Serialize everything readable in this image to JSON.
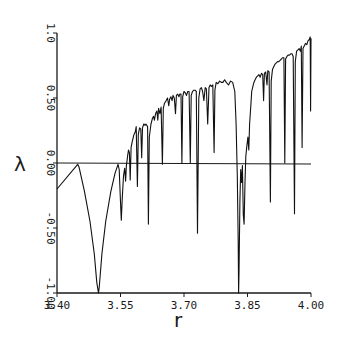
{
  "chart_data": {
    "type": "line",
    "title": "",
    "xlabel": "r",
    "ylabel": "λ",
    "xlim": [
      3.4,
      4.0
    ],
    "ylim": [
      -1.0,
      1.0
    ],
    "grid": false,
    "legend": null,
    "x_ticks": [
      "3.40",
      "3.55",
      "3.70",
      "3.85",
      "4.00"
    ],
    "y_ticks": [
      "1.0",
      "0.50",
      "0.00",
      "-0.50",
      "-1.00"
    ],
    "reference_line": {
      "y": 0.0,
      "label": "λ = 0"
    },
    "series": [
      {
        "name": "Lyapunov exponent",
        "color": "#111111",
        "points": [
          [
            3.4,
            -0.2
          ],
          [
            3.449,
            -0.01
          ],
          [
            3.452,
            -0.03
          ],
          [
            3.465,
            -0.22
          ],
          [
            3.478,
            -0.45
          ],
          [
            3.488,
            -0.7
          ],
          [
            3.494,
            -0.92
          ],
          [
            3.498,
            -1.0
          ],
          [
            3.5,
            -0.95
          ],
          [
            3.506,
            -0.7
          ],
          [
            3.515,
            -0.45
          ],
          [
            3.527,
            -0.22
          ],
          [
            3.537,
            -0.08
          ],
          [
            3.544,
            -0.01
          ],
          [
            3.547,
            -0.05
          ],
          [
            3.55,
            -0.3
          ],
          [
            3.552,
            -0.44
          ],
          [
            3.554,
            -0.28
          ],
          [
            3.557,
            -0.1
          ],
          [
            3.56,
            -0.04
          ],
          [
            3.562,
            -0.14
          ],
          [
            3.564,
            -0.02
          ],
          [
            3.567,
            0.06
          ],
          [
            3.569,
            0.1
          ],
          [
            3.571,
            0.08
          ],
          [
            3.573,
            -0.13
          ],
          [
            3.575,
            0.12
          ],
          [
            3.578,
            0.17
          ],
          [
            3.582,
            0.22
          ],
          [
            3.585,
            0.24
          ],
          [
            3.587,
            0.28
          ],
          [
            3.59,
            -0.18
          ],
          [
            3.592,
            0.22
          ],
          [
            3.595,
            0.27
          ],
          [
            3.598,
            0.26
          ],
          [
            3.6,
            0.04
          ],
          [
            3.602,
            0.27
          ],
          [
            3.605,
            0.3
          ],
          [
            3.608,
            0.29
          ],
          [
            3.61,
            0.3
          ],
          [
            3.614,
            0.28
          ],
          [
            3.616,
            -0.47
          ],
          [
            3.618,
            0.2
          ],
          [
            3.622,
            0.3
          ],
          [
            3.625,
            0.34
          ],
          [
            3.628,
            0.36
          ],
          [
            3.63,
            0.33
          ],
          [
            3.633,
            0.38
          ],
          [
            3.636,
            0.4
          ],
          [
            3.638,
            0.33
          ],
          [
            3.64,
            0.42
          ],
          [
            3.643,
            0.38
          ],
          [
            3.646,
            0.43
          ],
          [
            3.649,
            -0.01
          ],
          [
            3.651,
            0.42
          ],
          [
            3.654,
            0.46
          ],
          [
            3.658,
            0.48
          ],
          [
            3.661,
            0.5
          ],
          [
            3.664,
            0.44
          ],
          [
            3.666,
            0.49
          ],
          [
            3.669,
            0.51
          ],
          [
            3.672,
            0.48
          ],
          [
            3.674,
            0.52
          ],
          [
            3.677,
            0.5
          ],
          [
            3.68,
            0.38
          ],
          [
            3.682,
            0.52
          ],
          [
            3.685,
            0.53
          ],
          [
            3.688,
            0.51
          ],
          [
            3.69,
            0.53
          ],
          [
            3.693,
            0.53
          ],
          [
            3.695,
            0.0
          ],
          [
            3.697,
            0.51
          ],
          [
            3.7,
            0.55
          ],
          [
            3.703,
            0.54
          ],
          [
            3.706,
            0.52
          ],
          [
            3.709,
            0.55
          ],
          [
            3.712,
            0.55
          ],
          [
            3.715,
            0.0
          ],
          [
            3.717,
            0.52
          ],
          [
            3.72,
            0.55
          ],
          [
            3.723,
            0.56
          ],
          [
            3.726,
            0.56
          ],
          [
            3.729,
            0.55
          ],
          [
            3.732,
            -0.54
          ],
          [
            3.735,
            0.5
          ],
          [
            3.738,
            0.57
          ],
          [
            3.741,
            0.58
          ],
          [
            3.744,
            0.55
          ],
          [
            3.747,
            0.48
          ],
          [
            3.75,
            0.58
          ],
          [
            3.753,
            0.57
          ],
          [
            3.756,
            0.3
          ],
          [
            3.759,
            0.58
          ],
          [
            3.762,
            0.6
          ],
          [
            3.765,
            0.59
          ],
          [
            3.768,
            0.6
          ],
          [
            3.771,
            0.08
          ],
          [
            3.773,
            0.56
          ],
          [
            3.776,
            0.62
          ],
          [
            3.78,
            0.61
          ],
          [
            3.784,
            0.63
          ],
          [
            3.788,
            0.62
          ],
          [
            3.792,
            0.62
          ],
          [
            3.796,
            0.64
          ],
          [
            3.8,
            0.62
          ],
          [
            3.805,
            0.6
          ],
          [
            3.81,
            0.63
          ],
          [
            3.815,
            0.62
          ],
          [
            3.82,
            0.55
          ],
          [
            3.823,
            0.3
          ],
          [
            3.826,
            -0.1
          ],
          [
            3.828,
            -0.6
          ],
          [
            3.829,
            -1.0
          ],
          [
            3.83,
            -0.85
          ],
          [
            3.832,
            -0.3
          ],
          [
            3.834,
            -0.05
          ],
          [
            3.836,
            -0.15
          ],
          [
            3.838,
            -0.02
          ],
          [
            3.84,
            -0.4
          ],
          [
            3.842,
            -0.47
          ],
          [
            3.844,
            -0.15
          ],
          [
            3.846,
            0.05
          ],
          [
            3.848,
            0.12
          ],
          [
            3.851,
            0.2
          ],
          [
            3.853,
            0.1
          ],
          [
            3.855,
            0.3
          ],
          [
            3.858,
            0.45
          ],
          [
            3.86,
            0.55
          ],
          [
            3.862,
            0.58
          ],
          [
            3.865,
            0.62
          ],
          [
            3.868,
            0.64
          ],
          [
            3.871,
            0.66
          ],
          [
            3.874,
            0.67
          ],
          [
            3.877,
            0.68
          ],
          [
            3.88,
            0.66
          ],
          [
            3.883,
            0.69
          ],
          [
            3.886,
            0.68
          ],
          [
            3.888,
            0.48
          ],
          [
            3.89,
            0.69
          ],
          [
            3.893,
            0.7
          ],
          [
            3.896,
            0.6
          ],
          [
            3.898,
            0.71
          ],
          [
            3.901,
            0.7
          ],
          [
            3.904,
            -0.3
          ],
          [
            3.906,
            0.63
          ],
          [
            3.909,
            0.72
          ],
          [
            3.912,
            0.74
          ],
          [
            3.915,
            0.76
          ],
          [
            3.918,
            0.77
          ],
          [
            3.921,
            0.78
          ],
          [
            3.924,
            0.78
          ],
          [
            3.927,
            0.79
          ],
          [
            3.93,
            0.8
          ],
          [
            3.933,
            0.81
          ],
          [
            3.936,
            0.81
          ],
          [
            3.938,
            0.0
          ],
          [
            3.94,
            0.8
          ],
          [
            3.943,
            0.82
          ],
          [
            3.946,
            0.83
          ],
          [
            3.949,
            0.83
          ],
          [
            3.952,
            0.84
          ],
          [
            3.955,
            0.84
          ],
          [
            3.958,
            0.82
          ],
          [
            3.961,
            -0.39
          ],
          [
            3.963,
            0.78
          ],
          [
            3.966,
            0.86
          ],
          [
            3.969,
            0.87
          ],
          [
            3.972,
            0.88
          ],
          [
            3.975,
            0.86
          ],
          [
            3.977,
            0.9
          ],
          [
            3.979,
            0.12
          ],
          [
            3.981,
            0.88
          ],
          [
            3.984,
            0.9
          ],
          [
            3.987,
            0.92
          ],
          [
            3.99,
            0.91
          ],
          [
            3.993,
            0.94
          ],
          [
            3.996,
            0.95
          ],
          [
            3.998,
            0.97
          ],
          [
            3.999,
            0.4
          ],
          [
            4.0,
            0.96
          ]
        ]
      }
    ]
  },
  "plot": {
    "px_left": 57,
    "px_right": 311,
    "px_top": 33,
    "px_bottom": 293
  }
}
